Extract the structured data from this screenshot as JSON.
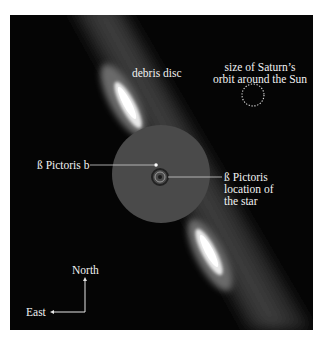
{
  "image": {
    "subject": "Beta Pictoris debris disc and planet",
    "colors": {
      "background": "#050505",
      "page": "#ffffff",
      "mask": "#4a4a4a",
      "label": "#f2f2f2",
      "disc_glow": "#ffffff"
    }
  },
  "labels": {
    "debris_disc": "debris disc",
    "saturn_line1": "size of Saturn’s",
    "saturn_line2": "orbit around the Sun",
    "planet": "ß Pictoris b",
    "star_line1": "ß Pictoris",
    "star_line2": "location of",
    "star_line3": "the star",
    "north": "North",
    "east": "East"
  }
}
